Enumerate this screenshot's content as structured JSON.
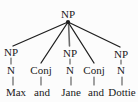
{
  "figure": {
    "type": "syntax-tree",
    "background_color": "#fcfcfc",
    "line_color": "#1f1f1f",
    "text_color": "#1a1a1a"
  },
  "nodes": {
    "root": {
      "label": "NP",
      "x": 68,
      "y": 14
    },
    "level2": [
      {
        "label": "NP",
        "x": 11,
        "y": 52
      },
      {
        "label": "Conj",
        "x": 41,
        "y": 70
      },
      {
        "label": "NP",
        "x": 70,
        "y": 53
      },
      {
        "label": "Conj",
        "x": 94,
        "y": 70
      },
      {
        "label": "NP",
        "x": 121,
        "y": 54
      }
    ],
    "level3": [
      {
        "label": "N",
        "x": 11,
        "y": 70
      },
      {
        "label": "N",
        "x": 70,
        "y": 70
      },
      {
        "label": "N",
        "x": 121,
        "y": 70
      }
    ]
  },
  "terminals": [
    {
      "word": "Max",
      "x": 16,
      "y": 92
    },
    {
      "word": "and",
      "x": 42,
      "y": 92
    },
    {
      "word": "Jane",
      "x": 71,
      "y": 92
    },
    {
      "word": "and",
      "x": 96,
      "y": 92
    },
    {
      "word": "Dottie",
      "x": 122,
      "y": 92
    }
  ],
  "edges": {
    "apex": {
      "x": 68,
      "y": 22
    },
    "branches": [
      {
        "from": "root",
        "to": "NP-1",
        "x2": 13,
        "y2": 46
      },
      {
        "from": "root",
        "to": "Conj-1",
        "x2": 41,
        "y2": 63
      },
      {
        "from": "root",
        "to": "NP-2",
        "x2": 69,
        "y2": 46
      },
      {
        "from": "root",
        "to": "Conj-2",
        "x2": 94,
        "y2": 63
      },
      {
        "from": "root",
        "to": "NP-3",
        "x2": 120,
        "y2": 47
      }
    ],
    "stems": [
      {
        "label": "NP1-to-N1",
        "x": 11,
        "y1": 58,
        "y2": 64
      },
      {
        "label": "N1-to-Max",
        "x": 13,
        "y1": 76,
        "y2": 85
      },
      {
        "label": "Conj1-to-and",
        "x": 41,
        "y1": 76,
        "y2": 85
      },
      {
        "label": "NP2-to-N2",
        "x": 70,
        "y1": 59,
        "y2": 64
      },
      {
        "label": "N2-to-Jane",
        "x": 71,
        "y1": 76,
        "y2": 85
      },
      {
        "label": "Conj2-to-and",
        "x": 94,
        "y1": 76,
        "y2": 85
      },
      {
        "label": "NP3-to-N3",
        "x": 121,
        "y1": 60,
        "y2": 64
      },
      {
        "label": "N3-to-Dottie",
        "x": 122,
        "y1": 76,
        "y2": 85
      }
    ]
  }
}
